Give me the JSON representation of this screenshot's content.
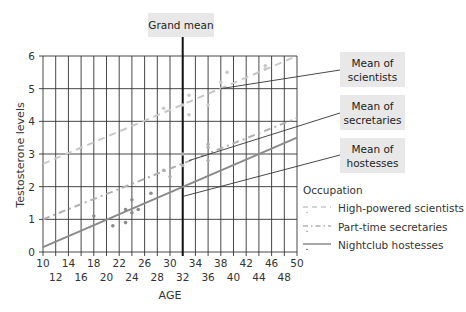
{
  "chart_data": {
    "type": "scatter",
    "title": "",
    "xlabel": "AGE",
    "ylabel": "Testosterone levels",
    "xlim": [
      10,
      50
    ],
    "ylim": [
      0,
      6
    ],
    "grid": true,
    "x_ticks_top_row": [
      10,
      14,
      18,
      22,
      26,
      30,
      34,
      38,
      42,
      46,
      50
    ],
    "x_ticks_bottom_row": [
      12,
      16,
      20,
      24,
      28,
      32,
      36,
      40,
      44,
      48
    ],
    "y_ticks": [
      0,
      1,
      2,
      3,
      4,
      5,
      6
    ],
    "grand_mean": {
      "label": "Grand mean",
      "x": 32
    },
    "series": [
      {
        "name": "High-powered scientists",
        "style": "dashed",
        "color": "#c8c8c8",
        "regression": [
          [
            10,
            2.7
          ],
          [
            50,
            6.0
          ]
        ],
        "mean_label": "Mean of scientists",
        "mean_point": [
          38,
          5.0
        ],
        "points": [
          [
            29,
            4.4
          ],
          [
            32,
            4.5
          ],
          [
            33,
            4.8
          ],
          [
            33,
            4.2
          ],
          [
            36,
            4.5
          ],
          [
            38,
            5.2
          ],
          [
            39,
            5.5
          ],
          [
            45,
            5.6
          ],
          [
            45,
            5.7
          ]
        ]
      },
      {
        "name": "Part-time secretaries",
        "style": "dash-dot",
        "color": "#b0b0b0",
        "regression": [
          [
            10,
            1.0
          ],
          [
            50,
            4.1
          ]
        ],
        "mean_label": "Mean of secretaries",
        "mean_point": [
          33,
          2.8
        ],
        "points": [
          [
            29,
            2.5
          ],
          [
            30,
            2.3
          ],
          [
            32,
            3.0
          ],
          [
            32,
            2.65
          ],
          [
            36,
            3.3
          ],
          [
            36,
            3.2
          ],
          [
            36,
            2.8
          ]
        ]
      },
      {
        "name": "Nightclub hostesses",
        "style": "solid",
        "color": "#8a8a8a",
        "regression": [
          [
            10,
            0.15
          ],
          [
            50,
            3.5
          ]
        ],
        "mean_label": "Mean of hostesses",
        "mean_point": [
          32,
          1.7
        ],
        "points": [
          [
            18,
            1.1
          ],
          [
            21,
            0.8
          ],
          [
            23,
            0.9
          ],
          [
            23,
            1.3
          ],
          [
            24,
            1.6
          ],
          [
            24,
            1.2
          ],
          [
            25,
            1.3
          ],
          [
            27,
            1.8
          ]
        ]
      }
    ],
    "legend": {
      "title": "Occupation",
      "position": "right"
    }
  },
  "labels": {
    "grand_mean": "Grand mean",
    "mean_scientists_1": "Mean of",
    "mean_scientists_2": "scientists",
    "mean_secretaries_1": "Mean of",
    "mean_secretaries_2": "secretaries",
    "mean_hostesses_1": "Mean of",
    "mean_hostesses_2": "hostesses",
    "xlabel": "AGE",
    "ylabel": "Testosterone levels"
  },
  "legend": {
    "title": "Occupation",
    "items": [
      {
        "label": "High-powered scientists"
      },
      {
        "label": "Part-time secretaries"
      },
      {
        "label": "Nightclub hostesses"
      }
    ]
  }
}
